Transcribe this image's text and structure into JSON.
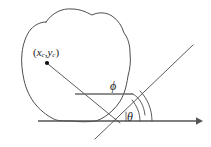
{
  "figure": {
    "background_color": "#ffffff",
    "stroke_color": "#3a3a3a",
    "axis_color": "#555555",
    "label_color": "#1a1a1a"
  },
  "labels": {
    "point_open_paren": "(",
    "point_x": "x",
    "point_x_sub": "c",
    "point_comma": ",",
    "point_y": "y",
    "point_y_sub": "c",
    "point_close_paren": ")",
    "point_full": "(xc,yc)",
    "phi": "ϕ",
    "theta": "θ"
  },
  "elements": {
    "region_name": "irregular-closed-region",
    "centroid_marker": "filled-dot",
    "axis_name": "horizontal-axis-with-arrow",
    "ray_name": "diagonal-ray",
    "connector_name": "centroid-to-vertex-line",
    "chord_name": "phi-reference-chord",
    "phi_arc_name": "phi-angle-arc",
    "theta_arc_name": "theta-angle-arc",
    "theta_outer_arc_name": "theta-outer-angle-arc"
  },
  "geometry": {
    "centroid_point": [
      47,
      63
    ],
    "vertex_point": [
      118,
      121
    ],
    "ray_start": [
      95,
      139
    ],
    "ray_end": [
      193,
      45
    ],
    "axis_start": [
      38,
      121
    ],
    "axis_end": [
      200,
      121
    ],
    "chord_start": [
      75,
      94
    ],
    "chord_end": [
      131,
      94
    ]
  }
}
